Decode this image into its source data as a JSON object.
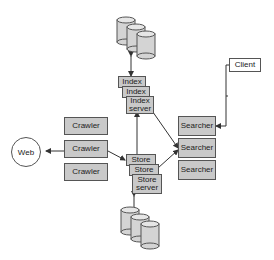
{
  "diagram": {
    "nodes": {
      "web": "Web",
      "client": "Client",
      "crawlers": [
        "Crawler",
        "Crawler",
        "Crawler"
      ],
      "index": [
        "Index",
        "Index",
        "Index\nserver"
      ],
      "store": [
        "Store",
        "Store",
        "Store\nserver"
      ],
      "searchers": [
        "Searcher",
        "Searcher",
        "Searcher"
      ],
      "databases": [
        "top-database-cluster",
        "bottom-database-cluster"
      ]
    },
    "edges": [
      {
        "from": "Crawler",
        "to": "Web"
      },
      {
        "from": "Crawler",
        "to": "Store server"
      },
      {
        "from": "Store server",
        "to": "Index server"
      },
      {
        "from": "Index server",
        "to": "top-database-cluster"
      },
      {
        "from": "Store server",
        "to": "bottom-database-cluster"
      },
      {
        "from": "Index server",
        "to": "Searcher"
      },
      {
        "from": "Store server",
        "to": "Searcher"
      },
      {
        "from": "Client",
        "to": "Searcher"
      }
    ],
    "colors": {
      "box_fill": "#c9c9c9",
      "db_fill": "#d4d4d4",
      "stroke": "#555555"
    }
  }
}
